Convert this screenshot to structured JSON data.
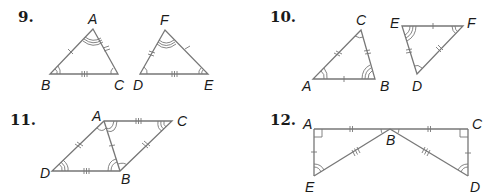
{
  "colors": {
    "line": "#777777",
    "text": "#1a1a1a",
    "background": "#ffffff"
  },
  "problems": [
    {
      "number": "9.",
      "figures": [
        {
          "name": "triangle-ABC",
          "vertices": {
            "A": [
              93,
              29
            ],
            "B": [
              50,
              74
            ],
            "C": [
              118,
              74
            ]
          }
        },
        {
          "name": "triangle-FDE",
          "vertices": {
            "F": [
              165,
              30
            ],
            "D": [
              140,
              74
            ],
            "E": [
              208,
              74
            ]
          }
        }
      ],
      "labels": {
        "A": "A",
        "B": "B",
        "C": "C",
        "F": "F",
        "D": "D",
        "E": "E"
      }
    },
    {
      "number": "10.",
      "figures": [
        {
          "name": "triangle-ABC",
          "vertices": {
            "C": [
              361,
              30
            ],
            "A": [
              313,
              79
            ],
            "B": [
              375,
              79
            ]
          }
        },
        {
          "name": "triangle-EFD",
          "vertices": {
            "E": [
              402,
              26
            ],
            "F": [
              463,
              26
            ],
            "D": [
              417,
              74
            ]
          }
        }
      ],
      "labels": {
        "A": "A",
        "B": "B",
        "C": "C",
        "E": "E",
        "F": "F",
        "D": "D"
      }
    },
    {
      "number": "11.",
      "figures": [
        {
          "name": "parallelogram-ACBD",
          "vertices": {
            "A": [
              104,
              121
            ],
            "C": [
              172,
              121
            ],
            "B": [
              120,
              171
            ],
            "D": [
              52,
              171
            ]
          }
        }
      ],
      "labels": {
        "A": "A",
        "B": "B",
        "C": "C",
        "D": "D"
      }
    },
    {
      "number": "12.",
      "figures": [
        {
          "name": "triangles-ABE-CBD",
          "vertices": {
            "A": [
              314,
              129
            ],
            "B": [
              390,
              129
            ],
            "C": [
              468,
              129
            ],
            "E": [
              314,
              176
            ],
            "D": [
              468,
              176
            ]
          }
        }
      ],
      "labels": {
        "A": "A",
        "B": "B",
        "C": "C",
        "D": "D",
        "E": "E"
      }
    }
  ]
}
